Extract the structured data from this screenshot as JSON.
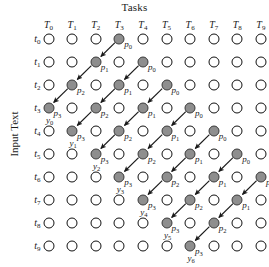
{
  "figure": {
    "top_title": "Tasks",
    "left_title": "Input Text",
    "type": "wavefront-schedule-grid"
  },
  "axes": {
    "columns": [
      {
        "name": "T",
        "index": "0",
        "label": "T0"
      },
      {
        "name": "T",
        "index": "1",
        "label": "T1"
      },
      {
        "name": "T",
        "index": "2",
        "label": "T2"
      },
      {
        "name": "T",
        "index": "3",
        "label": "T3"
      },
      {
        "name": "T",
        "index": "4",
        "label": "T4"
      },
      {
        "name": "T",
        "index": "5",
        "label": "T5"
      },
      {
        "name": "T",
        "index": "6",
        "label": "T6"
      },
      {
        "name": "T",
        "index": "7",
        "label": "T7"
      },
      {
        "name": "T",
        "index": "8",
        "label": "T8"
      },
      {
        "name": "T",
        "index": "9",
        "label": "T9"
      }
    ],
    "rows": [
      {
        "name": "t",
        "index": "0",
        "label": "t0"
      },
      {
        "name": "t",
        "index": "1",
        "label": "t1"
      },
      {
        "name": "t",
        "index": "2",
        "label": "t2"
      },
      {
        "name": "t",
        "index": "3",
        "label": "t3"
      },
      {
        "name": "t",
        "index": "4",
        "label": "t4"
      },
      {
        "name": "t",
        "index": "5",
        "label": "t5"
      },
      {
        "name": "t",
        "index": "6",
        "label": "t6"
      },
      {
        "name": "t",
        "index": "7",
        "label": "t7"
      },
      {
        "name": "t",
        "index": "8",
        "label": "t8"
      },
      {
        "name": "t",
        "index": "9",
        "label": "t9"
      }
    ]
  },
  "colors": {
    "active_node_fill": "#8e8e8e",
    "active_node_stroke": "#3a3a3a",
    "idle_node_fill": "#ffffff",
    "idle_node_stroke": "#111111",
    "arrow": "#1a1a1a",
    "background": "#ffffff"
  },
  "chart_data": {
    "type": "scatter",
    "title": "Tasks",
    "xlabel": "Tasks",
    "ylabel": "Input Text",
    "grid": false,
    "x_tick_labels": [
      "T0",
      "T1",
      "T2",
      "T3",
      "T4",
      "T5",
      "T6",
      "T7",
      "T8",
      "T9"
    ],
    "y_tick_labels": [
      "t0",
      "t1",
      "t2",
      "t3",
      "t4",
      "t5",
      "t6",
      "t7",
      "t8",
      "t9"
    ],
    "xlim": [
      0,
      9
    ],
    "ylim": [
      0,
      9
    ],
    "note": "Each chain k starts at column 3+k on row k and steps down-left through p0,p1,p2,p3 ending at column k on row 3+k labelled y_k.",
    "chains": [
      {
        "id": "chain-0",
        "output": "y0",
        "output_name": "y",
        "output_index": "0",
        "nodes": [
          {
            "stage": "p0",
            "stage_name": "p",
            "stage_index": "0",
            "col": 3,
            "row": 0
          },
          {
            "stage": "p1",
            "stage_name": "p",
            "stage_index": "1",
            "col": 2,
            "row": 1
          },
          {
            "stage": "p2",
            "stage_name": "p",
            "stage_index": "2",
            "col": 1,
            "row": 2
          },
          {
            "stage": "p3",
            "stage_name": "p",
            "stage_index": "3",
            "col": 0,
            "row": 3
          }
        ]
      },
      {
        "id": "chain-1",
        "output": "y1",
        "output_name": "y",
        "output_index": "1",
        "nodes": [
          {
            "stage": "p0",
            "stage_name": "p",
            "stage_index": "0",
            "col": 4,
            "row": 1
          },
          {
            "stage": "p1",
            "stage_name": "p",
            "stage_index": "1",
            "col": 3,
            "row": 2
          },
          {
            "stage": "p2",
            "stage_name": "p",
            "stage_index": "2",
            "col": 2,
            "row": 3
          },
          {
            "stage": "p3",
            "stage_name": "p",
            "stage_index": "3",
            "col": 1,
            "row": 4
          }
        ]
      },
      {
        "id": "chain-2",
        "output": "y2",
        "output_name": "y",
        "output_index": "2",
        "nodes": [
          {
            "stage": "p0",
            "stage_name": "p",
            "stage_index": "0",
            "col": 5,
            "row": 2
          },
          {
            "stage": "p1",
            "stage_name": "p",
            "stage_index": "1",
            "col": 4,
            "row": 3
          },
          {
            "stage": "p2",
            "stage_name": "p",
            "stage_index": "2",
            "col": 3,
            "row": 4
          },
          {
            "stage": "p3",
            "stage_name": "p",
            "stage_index": "3",
            "col": 2,
            "row": 5
          }
        ]
      },
      {
        "id": "chain-3",
        "output": "y3",
        "output_name": "y",
        "output_index": "3",
        "nodes": [
          {
            "stage": "p0",
            "stage_name": "p",
            "stage_index": "0",
            "col": 6,
            "row": 3
          },
          {
            "stage": "p1",
            "stage_name": "p",
            "stage_index": "1",
            "col": 5,
            "row": 4
          },
          {
            "stage": "p2",
            "stage_name": "p",
            "stage_index": "2",
            "col": 4,
            "row": 5
          },
          {
            "stage": "p3",
            "stage_name": "p",
            "stage_index": "3",
            "col": 3,
            "row": 6
          }
        ]
      },
      {
        "id": "chain-4",
        "output": "y4",
        "output_name": "y",
        "output_index": "4",
        "nodes": [
          {
            "stage": "p0",
            "stage_name": "p",
            "stage_index": "0",
            "col": 7,
            "row": 4
          },
          {
            "stage": "p1",
            "stage_name": "p",
            "stage_index": "1",
            "col": 6,
            "row": 5
          },
          {
            "stage": "p2",
            "stage_name": "p",
            "stage_index": "2",
            "col": 5,
            "row": 6
          },
          {
            "stage": "p3",
            "stage_name": "p",
            "stage_index": "3",
            "col": 4,
            "row": 7
          }
        ]
      },
      {
        "id": "chain-5",
        "output": "y5",
        "output_name": "y",
        "output_index": "5",
        "nodes": [
          {
            "stage": "p0",
            "stage_name": "p",
            "stage_index": "0",
            "col": 8,
            "row": 5
          },
          {
            "stage": "p1",
            "stage_name": "p",
            "stage_index": "1",
            "col": 7,
            "row": 6
          },
          {
            "stage": "p2",
            "stage_name": "p",
            "stage_index": "2",
            "col": 6,
            "row": 7
          },
          {
            "stage": "p3",
            "stage_name": "p",
            "stage_index": "3",
            "col": 5,
            "row": 8
          }
        ]
      },
      {
        "id": "chain-6",
        "output": "y6",
        "output_name": "y",
        "output_index": "6",
        "nodes": [
          {
            "stage": "p0",
            "stage_name": "p",
            "stage_index": "0",
            "col": 9,
            "row": 6
          },
          {
            "stage": "p1",
            "stage_name": "p",
            "stage_index": "1",
            "col": 8,
            "row": 7
          },
          {
            "stage": "p2",
            "stage_name": "p",
            "stage_index": "2",
            "col": 7,
            "row": 8
          },
          {
            "stage": "p3",
            "stage_name": "p",
            "stage_index": "3",
            "col": 6,
            "row": 9
          }
        ]
      }
    ]
  }
}
